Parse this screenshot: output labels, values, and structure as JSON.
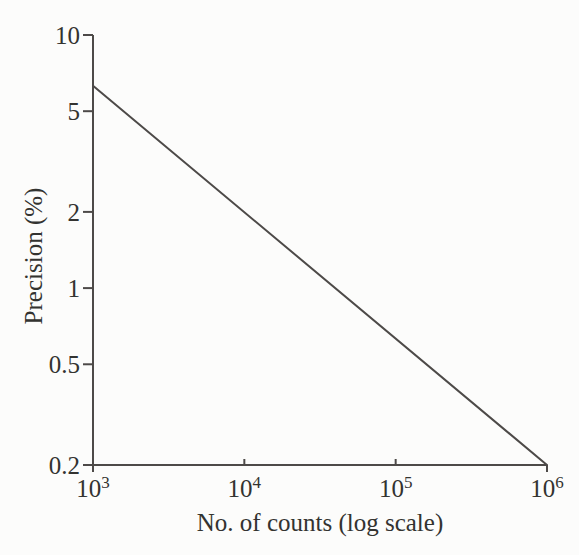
{
  "page": {
    "background": "#fcfcfb",
    "ink_text": "#333330",
    "ink_line": "#4d4a48"
  },
  "chart_data": {
    "type": "line",
    "title": "",
    "xlabel": "No. of counts (log scale)",
    "ylabel": "Precision (%)",
    "x_scale": "log",
    "y_scale": "log",
    "xlim": [
      1000,
      1000000
    ],
    "ylim": [
      0.2,
      10
    ],
    "grid": false,
    "legend": "none",
    "x_ticks": [
      {
        "value": 1000,
        "base": "10",
        "exp": "3"
      },
      {
        "value": 10000,
        "base": "10",
        "exp": "4"
      },
      {
        "value": 100000,
        "base": "10",
        "exp": "5"
      },
      {
        "value": 1000000,
        "base": "10",
        "exp": "6"
      }
    ],
    "y_ticks": [
      {
        "value": 10,
        "label": "10"
      },
      {
        "value": 5,
        "label": "5"
      },
      {
        "value": 2,
        "label": "2"
      },
      {
        "value": 1,
        "label": "1"
      },
      {
        "value": 0.5,
        "label": "0.5"
      },
      {
        "value": 0.2,
        "label": "0.2"
      }
    ],
    "series": [
      {
        "name": "counting-statistics precision line",
        "points": [
          [
            1000,
            6.3
          ],
          [
            1000000,
            0.2
          ]
        ]
      }
    ]
  }
}
